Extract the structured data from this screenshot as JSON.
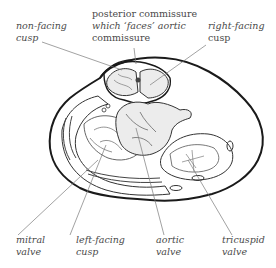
{
  "diagram": {
    "type": "anatomical-cross-section",
    "colors": {
      "outline": "#1a1a1a",
      "detail": "#555555",
      "leader": "#7a7a7a",
      "cusp_fill": "#ececec",
      "text": "#4a4a4a",
      "background": "#ffffff"
    },
    "labels": {
      "non_facing_cusp": {
        "line1": "non-facing",
        "line2": "cusp"
      },
      "posterior_commissure": {
        "line1": "posterior commissure",
        "line2": "which ‘faces’ aortic",
        "line3": "commissure"
      },
      "right_facing_cusp": {
        "line1": "right-facing",
        "line2": "cusp"
      },
      "mitral_valve": {
        "line1": "mitral",
        "line2": "valve"
      },
      "left_facing_cusp": {
        "line1": "left-facing",
        "line2": "cusp"
      },
      "aortic_valve": {
        "line1": "aortic",
        "line2": "valve"
      },
      "tricuspid_valve": {
        "line1": "tricuspid",
        "line2": "valve"
      }
    }
  }
}
